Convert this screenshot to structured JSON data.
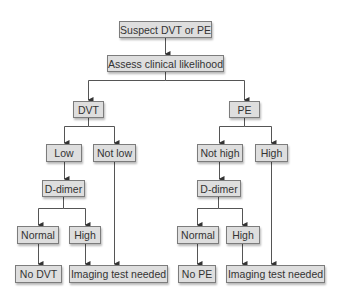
{
  "diagram": {
    "type": "flowchart",
    "colors": {
      "box_fill": "#dedede",
      "box_border": "#7c7c7c",
      "text": "#333333",
      "line": "#555555"
    },
    "nodes": {
      "start": {
        "label": "Suspect DVT or PE"
      },
      "assess": {
        "label": "Assess clinical likelihood"
      },
      "dvt": {
        "label": "DVT"
      },
      "pe": {
        "label": "PE"
      },
      "dvt_low": {
        "label": "Low"
      },
      "dvt_not_low": {
        "label": "Not low"
      },
      "dvt_ddimer": {
        "prefix": "D",
        "label": "-dimer"
      },
      "dvt_normal": {
        "label": "Normal"
      },
      "dvt_high": {
        "label": "High"
      },
      "no_dvt": {
        "label": "No DVT"
      },
      "dvt_imaging": {
        "label": "Imaging test needed"
      },
      "pe_not_high": {
        "label": "Not high"
      },
      "pe_high": {
        "label": "High"
      },
      "pe_ddimer": {
        "prefix": "D",
        "label": "-dimer"
      },
      "pe_normal": {
        "label": "Normal"
      },
      "pe_ddimer_high": {
        "label": "High"
      },
      "no_pe": {
        "label": "No PE"
      },
      "pe_imaging": {
        "label": "Imaging test needed"
      }
    },
    "edges": [
      [
        "start",
        "assess"
      ],
      [
        "assess",
        "dvt"
      ],
      [
        "assess",
        "pe"
      ],
      [
        "dvt",
        "dvt_low"
      ],
      [
        "dvt",
        "dvt_not_low"
      ],
      [
        "dvt_low",
        "dvt_ddimer"
      ],
      [
        "dvt_ddimer",
        "dvt_normal"
      ],
      [
        "dvt_ddimer",
        "dvt_high"
      ],
      [
        "dvt_normal",
        "no_dvt"
      ],
      [
        "dvt_high",
        "dvt_imaging"
      ],
      [
        "dvt_not_low",
        "dvt_imaging"
      ],
      [
        "pe",
        "pe_not_high"
      ],
      [
        "pe",
        "pe_high"
      ],
      [
        "pe_not_high",
        "pe_ddimer"
      ],
      [
        "pe_ddimer",
        "pe_normal"
      ],
      [
        "pe_ddimer",
        "pe_ddimer_high"
      ],
      [
        "pe_normal",
        "no_pe"
      ],
      [
        "pe_ddimer_high",
        "pe_imaging"
      ],
      [
        "pe_high",
        "pe_imaging"
      ]
    ]
  }
}
